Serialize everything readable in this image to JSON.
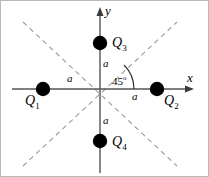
{
  "figure": {
    "type": "physics-diagram",
    "axes": {
      "x_label": "x",
      "y_label": "y",
      "origin": [
        99,
        88
      ],
      "x_arrow_tip": [
        193,
        88
      ],
      "y_arrow_tip": [
        99,
        6
      ],
      "color": "#555555"
    },
    "angle": {
      "value": "45",
      "degree_symbol": "o",
      "text": "45",
      "quadrant": 1
    },
    "distances": [
      {
        "label": "a",
        "side": "left"
      },
      {
        "label": "a",
        "side": "right"
      },
      {
        "label": "a",
        "side": "top"
      },
      {
        "label": "a",
        "side": "bottom"
      }
    ],
    "charges": [
      {
        "name": "Q",
        "index": "1",
        "position": [
          42,
          88
        ],
        "axis": "-x",
        "radius": 7,
        "color": "#000000"
      },
      {
        "name": "Q",
        "index": "2",
        "position": [
          156,
          88
        ],
        "axis": "+x",
        "radius": 7,
        "color": "#000000"
      },
      {
        "name": "Q",
        "index": "3",
        "position": [
          99,
          42
        ],
        "axis": "+y",
        "radius": 7,
        "color": "#000000"
      },
      {
        "name": "Q",
        "index": "4",
        "position": [
          99,
          140
        ],
        "axis": "-y",
        "radius": 7,
        "color": "#000000"
      }
    ],
    "dashed_lines": [
      {
        "name": "diagonal-up-right",
        "from": [
          22,
          165
        ],
        "to": [
          176,
          21
        ],
        "color": "#9a9a9a"
      },
      {
        "name": "diagonal-down-right",
        "from": [
          22,
          21
        ],
        "to": [
          176,
          165
        ],
        "color": "#9a9a9a"
      }
    ],
    "border_color": "#b9b9b9"
  }
}
